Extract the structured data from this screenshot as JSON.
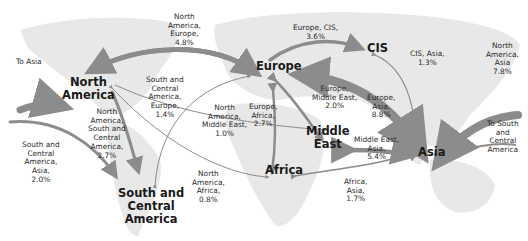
{
  "diagram": {
    "type": "flow-map",
    "colors": {
      "land": "#e6e6e6",
      "arrow": "#8c8c8c",
      "text": "#222222",
      "background": "#ffffff"
    },
    "regions": [
      {
        "id": "north_america",
        "label": "North\nAmerica"
      },
      {
        "id": "south_central_america",
        "label": "South and\nCentral\nAmerica"
      },
      {
        "id": "europe",
        "label": "Europe"
      },
      {
        "id": "cis",
        "label": "CIS"
      },
      {
        "id": "middle_east",
        "label": "Middle\nEast"
      },
      {
        "id": "africa",
        "label": "Africa"
      },
      {
        "id": "asia",
        "label": "Asia"
      }
    ],
    "flows": [
      {
        "id": "na_eu",
        "label": "North\nAmerica,\nEurope,\n4.8%",
        "between": [
          "North America",
          "Europe"
        ],
        "share_pct": 4.8
      },
      {
        "id": "eu_cis",
        "label": "Europe, CIS,\n3.6%",
        "between": [
          "Europe",
          "CIS"
        ],
        "share_pct": 3.6
      },
      {
        "id": "cis_asia",
        "label": "CIS, Asia,\n1.3%",
        "between": [
          "CIS",
          "Asia"
        ],
        "share_pct": 1.3
      },
      {
        "id": "na_asia",
        "label": "North\nAmerica,\nAsia\n7.8%",
        "between": [
          "North America",
          "Asia"
        ],
        "share_pct": 7.8
      },
      {
        "id": "sca_eu",
        "label": "South and\nCentral\nAmerica,\nEurope,\n1.4%",
        "between": [
          "South and Central America",
          "Europe"
        ],
        "share_pct": 1.4
      },
      {
        "id": "na_me",
        "label": "North\nAmerica,\nMiddle East,\n1.0%",
        "between": [
          "North America",
          "Middle East"
        ],
        "share_pct": 1.0
      },
      {
        "id": "eu_af",
        "label": "Europe,\nAfrica,\n2.7%",
        "between": [
          "Europe",
          "Africa"
        ],
        "share_pct": 2.7
      },
      {
        "id": "eu_me",
        "label": "Europe,\nMiddle East,\n2.0%",
        "between": [
          "Europe",
          "Middle East"
        ],
        "share_pct": 2.0
      },
      {
        "id": "eu_asia",
        "label": "Europe,\nAsia,\n8.8%",
        "between": [
          "Europe",
          "Asia"
        ],
        "share_pct": 8.8
      },
      {
        "id": "me_asia",
        "label": "Middle East,\nAsia,\n5.4%",
        "between": [
          "Middle East",
          "Asia"
        ],
        "share_pct": 5.4
      },
      {
        "id": "na_sca",
        "label": "North\nAmerica,\nSouth and\nCentral\nAmerica,\n2.7%",
        "between": [
          "North America",
          "South and Central America"
        ],
        "share_pct": 2.7
      },
      {
        "id": "sca_asia",
        "label": "South and\nCentral\nAmerica,\nAsia,\n2.0%",
        "between": [
          "South and Central America",
          "Asia"
        ],
        "share_pct": 2.0
      },
      {
        "id": "na_af",
        "label": "North\nAmerica,\nAfrica,\n0.8%",
        "between": [
          "North America",
          "Africa"
        ],
        "share_pct": 0.8
      },
      {
        "id": "af_asia",
        "label": "Africa,\nAsia,\n1.7%",
        "between": [
          "Africa",
          "Asia"
        ],
        "share_pct": 1.7
      }
    ],
    "edge_labels": {
      "to_asia": "To Asia",
      "to_sca": "To South\nand\nCentral\nAmerica"
    }
  }
}
